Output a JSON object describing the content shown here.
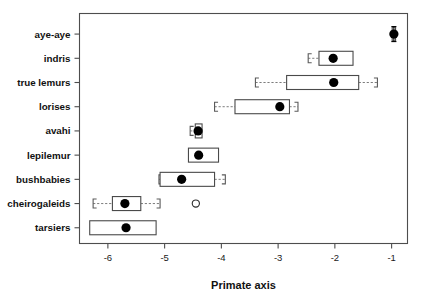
{
  "chart_data": {
    "type": "bar",
    "plot_style": "horizontal-boxplot",
    "title": "",
    "subtitle": "",
    "xlabel": "Primate axis",
    "ylabel": "",
    "xlim": [
      -6.5,
      -0.72
    ],
    "xticks": [
      -6,
      -5,
      -4,
      -3,
      -2,
      -1
    ],
    "xticklabels": [
      "-6",
      "-5",
      "-4",
      "-3",
      "-2",
      "-1"
    ],
    "grid": false,
    "legend": false,
    "legend_position": "none",
    "categories": [
      "aye-aye",
      "indris",
      "true lemurs",
      "lorises",
      "avahi",
      "lepilemur",
      "bushbabies",
      "cheirogaleids",
      "tarsiers"
    ],
    "values": [
      -0.96,
      -2.03,
      -2.02,
      -2.97,
      -4.41,
      -4.4,
      -4.7,
      -5.7,
      -5.68
    ],
    "boxes": [
      {
        "category": "aye-aye",
        "median": -0.96,
        "q1": -0.99,
        "q3": -0.93,
        "lower_whisker": -1.04,
        "upper_whisker": -0.88,
        "whisker_left_visible": false,
        "whisker_right_visible": false,
        "error_bar": true,
        "outliers": []
      },
      {
        "category": "indris",
        "median": -2.03,
        "q1": -2.28,
        "q3": -1.68,
        "lower_whisker": -2.47,
        "upper_whisker": -1.68,
        "whisker_left_visible": true,
        "whisker_right_visible": false,
        "error_bar": false,
        "outliers": []
      },
      {
        "category": "true lemurs",
        "median": -2.02,
        "q1": -2.85,
        "q3": -1.58,
        "lower_whisker": -3.4,
        "upper_whisker": -1.25,
        "whisker_left_visible": true,
        "whisker_right_visible": true,
        "error_bar": false,
        "outliers": []
      },
      {
        "category": "lorises",
        "median": -2.97,
        "q1": -3.76,
        "q3": -2.8,
        "lower_whisker": -4.12,
        "upper_whisker": -2.65,
        "whisker_left_visible": true,
        "whisker_right_visible": true,
        "error_bar": false,
        "outliers": []
      },
      {
        "category": "avahi",
        "median": -4.41,
        "q1": -4.46,
        "q3": -4.34,
        "lower_whisker": -4.55,
        "upper_whisker": -4.34,
        "whisker_left_visible": true,
        "whisker_right_visible": false,
        "error_bar": false,
        "outliers": []
      },
      {
        "category": "lepilemur",
        "median": -4.4,
        "q1": -4.58,
        "q3": -4.05,
        "lower_whisker": -4.58,
        "upper_whisker": -4.05,
        "whisker_left_visible": false,
        "whisker_right_visible": false,
        "error_bar": false,
        "outliers": []
      },
      {
        "category": "bushbabies",
        "median": -4.7,
        "q1": -5.08,
        "q3": -4.12,
        "lower_whisker": -5.1,
        "upper_whisker": -3.93,
        "whisker_left_visible": true,
        "whisker_right_visible": true,
        "error_bar": false,
        "outliers": []
      },
      {
        "category": "cheirogaleids",
        "median": -5.7,
        "q1": -5.92,
        "q3": -5.42,
        "lower_whisker": -6.26,
        "upper_whisker": -5.08,
        "whisker_left_visible": true,
        "whisker_right_visible": true,
        "error_bar": false,
        "outliers": [
          -4.45
        ]
      },
      {
        "category": "tarsiers",
        "median": -5.68,
        "q1": -6.32,
        "q3": -5.15,
        "lower_whisker": -6.32,
        "upper_whisker": -5.15,
        "whisker_left_visible": false,
        "whisker_right_visible": false,
        "error_bar": false,
        "outliers": []
      }
    ],
    "colors": {
      "box_fill": "#ffffff",
      "box_stroke": "#4a4a4a",
      "median_marker": "#000000",
      "whisker": "#6e6e6e",
      "outlier_stroke": "#2b2b2b",
      "axis": "#4d4d4d",
      "text": "#111111",
      "background": "#ffffff"
    }
  }
}
